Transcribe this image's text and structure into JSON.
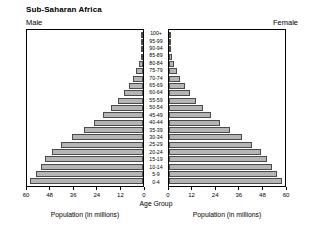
{
  "header": {
    "title": "Sub-Saharan Africa",
    "male_label": "Male",
    "female_label": "Female"
  },
  "captions": {
    "left_axis": "Population (in millions)",
    "right_axis": "Population (in millions)",
    "center": "Age Group"
  },
  "chart_data": {
    "type": "bar",
    "subtype": "population-pyramid",
    "title": "Sub-Saharan Africa",
    "xlabel": "Population (in millions)",
    "ylabel": "Age Group",
    "xlim": [
      0,
      60
    ],
    "xticks": [
      0,
      12,
      24,
      36,
      48,
      60
    ],
    "left_xticklabels": [
      "60",
      "48",
      "36",
      "24",
      "12",
      "0"
    ],
    "right_xticklabels": [
      "0",
      "12",
      "24",
      "36",
      "48",
      "60"
    ],
    "grid": false,
    "legend": [
      "Male",
      "Female"
    ],
    "legend_position": "top-outside",
    "categories": [
      "100+",
      "95-99",
      "90-94",
      "85-89",
      "80-84",
      "75-79",
      "70-74",
      "65-69",
      "60-64",
      "55-59",
      "50-54",
      "45-49",
      "40-44",
      "35-39",
      "30-34",
      "25-29",
      "20-24",
      "15-19",
      "10-14",
      "5-9",
      "0-4"
    ],
    "series": [
      {
        "name": "Male",
        "side": "left",
        "values": [
          0.1,
          0.3,
          0.6,
          1.2,
          2.2,
          3.4,
          5.0,
          7.2,
          9.8,
          12.8,
          16.4,
          20.5,
          25.2,
          30.6,
          36.6,
          42.2,
          47.0,
          50.5,
          53.0,
          55.5,
          58.5
        ]
      },
      {
        "name": "Female",
        "side": "right",
        "values": [
          0.1,
          0.4,
          0.8,
          1.5,
          2.7,
          4.1,
          5.9,
          8.2,
          10.9,
          14.0,
          17.6,
          21.7,
          26.4,
          31.7,
          37.5,
          42.9,
          47.4,
          50.8,
          53.2,
          55.7,
          58.6
        ]
      }
    ]
  }
}
